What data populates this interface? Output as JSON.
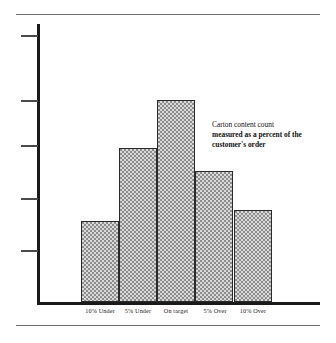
{
  "chart_data": {
    "type": "bar",
    "title": "",
    "subtitle": "",
    "xlabel": "",
    "ylabel": "",
    "categories": [
      "10% Under",
      "5% Under",
      "On  target",
      "5% Over",
      "10% Over"
    ],
    "values": [
      81,
      154,
      202,
      131,
      92
    ],
    "ylim": [
      0,
      278
    ],
    "grid": false,
    "legend": null,
    "y_axis_tick_labels": [],
    "y_axis_tick_count": 5,
    "y_axis_tick_positions": [
      35,
      100,
      145,
      198,
      250
    ],
    "annotations": [
      {
        "lines": [
          {
            "text": "Carton content count",
            "bold": false
          },
          {
            "text": "measured as a percent of the",
            "bold": true
          },
          {
            "text": "customer's order",
            "bold": true
          }
        ]
      }
    ]
  },
  "figure": {
    "bars": [
      {
        "category": "10% Under",
        "value": 81,
        "height_px": 81
      },
      {
        "category": "5% Under",
        "value": 154,
        "height_px": 154
      },
      {
        "category": "On  target",
        "value": 202,
        "height_px": 202
      },
      {
        "category": "5% Over",
        "value": 131,
        "height_px": 131
      },
      {
        "category": "10% Over",
        "value": 92,
        "height_px": 92
      }
    ],
    "colors": {
      "bar_fill": "#d9d9d9",
      "bar_pattern": "#8d8d8d",
      "bar_outline": "#2a2a2a",
      "axis": "#1a1a1a",
      "tick": "#4a4a4a",
      "rule": "#6b6b6b",
      "text": "#111111",
      "background": "#ffffff"
    },
    "annotation": {
      "line1": "Carton content count",
      "line2": "measured as a percent of the",
      "line3": "customer's order"
    }
  }
}
